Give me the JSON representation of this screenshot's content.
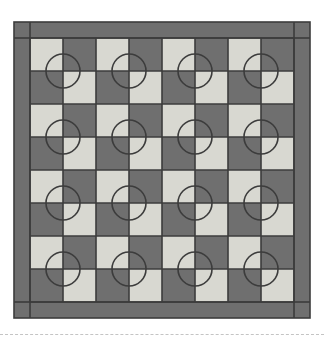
{
  "artwork": {
    "title": "Four-Patch Circle Quilt Block Layout",
    "type": "quilt-pattern-diagram",
    "canvas": {
      "width": 324,
      "height": 343,
      "background": "#ffffff"
    }
  },
  "palette": {
    "dark_fabric": "#6f6f6f",
    "light_fabric": "#d8d8d1",
    "seam_line": "#3c3c3c",
    "border_fabric": "#6f6f6f",
    "divider_line": "#c4c4c4"
  },
  "quilt": {
    "outer": {
      "x": 14,
      "y": 22,
      "width": 296,
      "height": 296
    },
    "border_width": 16,
    "inner": {
      "x": 30,
      "y": 38,
      "width": 264,
      "height": 264
    },
    "corner_squares": 4,
    "seam_stroke": 1.6
  },
  "grid": {
    "patch_columns": 8,
    "patch_rows": 8,
    "patch_size": 33,
    "block_columns": 4,
    "block_rows": 4,
    "block_size": 66,
    "start_color": "light",
    "description": "8 x 8 checkerboard of alternating dark and light square patches"
  },
  "circles": {
    "count": 16,
    "radius": 17,
    "stroke": "#3c3c3c",
    "stroke_width": 1.6,
    "fill": "none",
    "centers_x": [
      63,
      129,
      195,
      261
    ],
    "centers_y": [
      71,
      137,
      203,
      269
    ],
    "description": "One appliqued ring centered on each four-patch intersection"
  },
  "divider": {
    "y": 334,
    "style": "dashed",
    "label": "page-divider"
  }
}
